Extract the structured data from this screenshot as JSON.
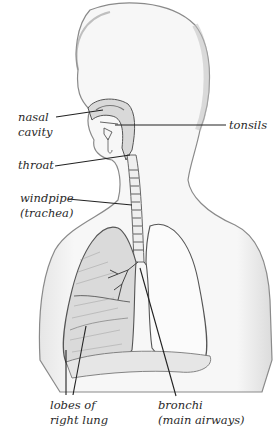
{
  "diagram": {
    "labels": {
      "nasal_cavity": [
        "nasal",
        "cavity"
      ],
      "tonsils": "tonsils",
      "throat": "throat",
      "windpipe": [
        "windpipe",
        "(trachea)"
      ],
      "lobes": [
        "lobes of",
        "right lung"
      ],
      "bronchi": [
        "bronchi",
        "(main airways)"
      ]
    },
    "colors": {
      "outline": "#6b6b6b",
      "shade": "#c8c8c8",
      "leader": "#222222",
      "text": "#2a2a2a"
    }
  }
}
